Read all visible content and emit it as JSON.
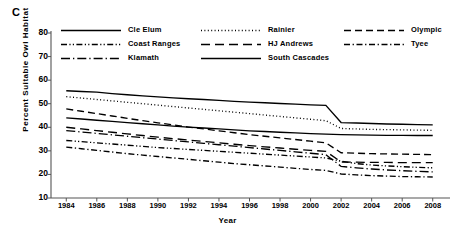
{
  "panel": {
    "label": "C"
  },
  "axes": {
    "ylabel": "Percent Suitable Owl Habitat",
    "xlabel": "Year",
    "yticks": [
      80,
      70,
      60,
      50,
      40,
      30,
      20,
      10
    ],
    "xticks": [
      1984,
      1986,
      1988,
      1990,
      1992,
      1994,
      1996,
      1998,
      2000,
      2002,
      2004,
      2006,
      2008
    ]
  },
  "legend": {
    "columns": [
      [
        {
          "label": "Cle Elum",
          "style": "solid"
        },
        {
          "label": "Coast Ranges",
          "style": "dashdotdot"
        },
        {
          "label": "Klamath",
          "style": "longdashdot"
        }
      ],
      [
        {
          "label": "Rainier",
          "style": "dotted"
        },
        {
          "label": "HJ Andrews",
          "style": "longdash"
        },
        {
          "label": "South Cascades",
          "style": "solid"
        }
      ],
      [
        {
          "label": "Olympic",
          "style": "dashed"
        },
        {
          "label": "Tyee",
          "style": "dashdot"
        }
      ]
    ]
  },
  "chart_data": {
    "type": "line",
    "title": "",
    "xlabel": "Year",
    "ylabel": "Percent Suitable Owl Habitat",
    "xlim": [
      1983,
      2009
    ],
    "ylim": [
      10,
      80
    ],
    "grid": false,
    "legend_position": "top",
    "x": [
      1984,
      1985,
      1986,
      1987,
      1988,
      1989,
      1990,
      1991,
      1992,
      1993,
      1994,
      1995,
      1996,
      1997,
      1998,
      1999,
      2000,
      2001,
      2002,
      2003,
      2004,
      2005,
      2006,
      2007,
      2008
    ],
    "series": [
      {
        "name": "Cle Elum",
        "style": "solid",
        "color": "#000000",
        "values": [
          55.5,
          55.2,
          54.9,
          54.3,
          53.8,
          53.3,
          52.9,
          52.5,
          52.1,
          51.8,
          51.4,
          51.0,
          50.7,
          50.4,
          50.1,
          49.8,
          49.5,
          49.3,
          42.0,
          41.8,
          41.6,
          41.4,
          41.3,
          41.1,
          41.0
        ]
      },
      {
        "name": "Rainier",
        "style": "dotted",
        "color": "#000000",
        "values": [
          53.0,
          52.4,
          51.8,
          51.2,
          50.6,
          50.0,
          49.4,
          48.8,
          48.2,
          47.6,
          47.0,
          46.4,
          45.8,
          45.2,
          44.6,
          44.0,
          43.4,
          42.8,
          39.5,
          39.3,
          39.1,
          39.0,
          38.9,
          38.8,
          38.7
        ]
      },
      {
        "name": "Olympic",
        "style": "dashed",
        "color": "#000000",
        "values": [
          47.8,
          46.8,
          45.8,
          44.8,
          43.8,
          42.8,
          41.9,
          41.0,
          40.1,
          39.3,
          38.5,
          37.7,
          36.9,
          36.2,
          35.5,
          34.8,
          34.1,
          33.4,
          29.2,
          29.0,
          28.8,
          28.7,
          28.6,
          28.5,
          28.4
        ]
      },
      {
        "name": "South Cascades",
        "style": "solid",
        "color": "#000000",
        "values": [
          44.0,
          43.5,
          43.0,
          42.5,
          42.0,
          41.5,
          41.0,
          40.5,
          40.1,
          39.7,
          39.3,
          38.9,
          38.5,
          38.2,
          37.9,
          37.6,
          37.3,
          37.1,
          36.9,
          36.8,
          36.7,
          36.6,
          36.6,
          36.5,
          36.5
        ]
      },
      {
        "name": "HJ Andrews",
        "style": "longdash",
        "color": "#000000",
        "values": [
          40.0,
          39.3,
          38.6,
          37.9,
          37.2,
          36.5,
          35.8,
          35.2,
          34.6,
          34.0,
          33.4,
          32.8,
          32.2,
          31.7,
          31.2,
          30.7,
          30.2,
          29.8,
          25.3,
          25.2,
          25.1,
          25.1,
          25.0,
          25.0,
          25.0
        ]
      },
      {
        "name": "Klamath",
        "style": "longdashdot",
        "color": "#000000",
        "values": [
          38.6,
          38.0,
          37.4,
          36.8,
          36.2,
          35.6,
          35.0,
          34.4,
          33.8,
          33.2,
          32.6,
          32.0,
          31.4,
          30.8,
          30.2,
          29.6,
          29.0,
          28.4,
          23.4,
          22.8,
          22.3,
          21.9,
          21.6,
          21.3,
          21.1
        ]
      },
      {
        "name": "Coast Ranges",
        "style": "dashdotdot",
        "color": "#000000",
        "values": [
          34.4,
          33.9,
          33.4,
          32.9,
          32.4,
          31.9,
          31.4,
          31.0,
          30.6,
          30.2,
          29.8,
          29.4,
          29.0,
          28.6,
          28.2,
          27.8,
          27.4,
          27.0,
          25.6,
          24.6,
          24.0,
          23.6,
          23.3,
          23.0,
          22.8
        ]
      },
      {
        "name": "Tyee",
        "style": "dashdot",
        "color": "#000000",
        "values": [
          31.6,
          30.9,
          30.2,
          29.5,
          28.8,
          28.2,
          27.6,
          27.0,
          26.4,
          25.8,
          25.2,
          24.6,
          24.1,
          23.6,
          23.1,
          22.6,
          22.1,
          21.7,
          20.2,
          19.8,
          19.5,
          19.3,
          19.1,
          19.0,
          18.9
        ]
      }
    ]
  }
}
